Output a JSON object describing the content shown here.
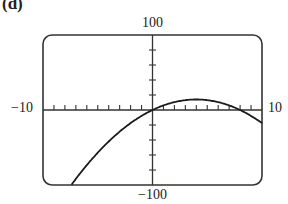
{
  "panel": {
    "label": "(d)"
  },
  "chart_data": {
    "type": "line",
    "title": "",
    "xlabel": "",
    "ylabel": "",
    "xlim": [
      -10,
      10
    ],
    "ylim": [
      -100,
      100
    ],
    "x_tick_labels": {
      "min": "-10",
      "max": "10"
    },
    "y_tick_labels": {
      "max": "100",
      "min": "-100"
    },
    "x_tick_step": 1,
    "y_tick_step": 20,
    "grid": false,
    "legend": null,
    "series": [
      {
        "name": "curve",
        "x": [
          -6.8,
          -6,
          -5,
          -4,
          -3,
          -2,
          -1,
          0,
          1,
          2,
          3,
          4,
          5,
          6,
          7,
          8,
          9,
          10
        ],
        "y": [
          -88,
          -73.5,
          -56.9,
          -42,
          -28.9,
          -17.5,
          -7.9,
          0,
          6.1,
          10.5,
          13.1,
          14,
          13.1,
          10.5,
          6.1,
          0,
          -7.9,
          -17.5
        ]
      }
    ]
  },
  "labels": {
    "y_max": "100",
    "y_min": "−100",
    "x_min": "−10",
    "x_max": "10"
  }
}
